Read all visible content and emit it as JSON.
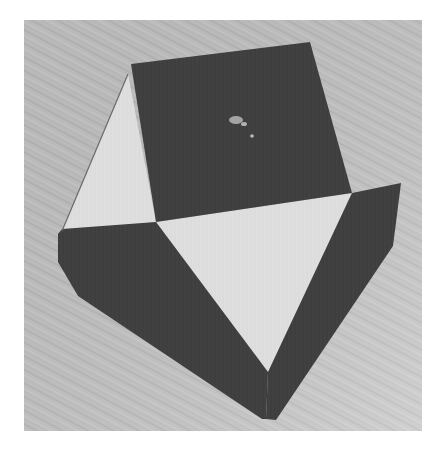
{
  "image": {
    "description": "Grayscale photograph of a folded paper pentagon-like shape on a textured wood-grain surface",
    "colors": {
      "background": "#ffffff",
      "surface": "#c4c4c4",
      "surface_light": "#d6d6d6",
      "dark_paper": "#3e3e3e",
      "light_paper": "#dedede",
      "fold_line": "#5a5a5a"
    },
    "photo_bounds": {
      "x": 24,
      "y": 20,
      "width": 398,
      "height": 411
    },
    "shapes": {
      "dark_square": "131,64 310,42 352,193 156,222",
      "light_left_triangle": "128,74 156,222 62,231",
      "light_center_triangle": "156,222 352,193 268,372",
      "dark_left_band": "58,234 62,229 156,222 268,372 266,419 262,419 78,296 58,262",
      "dark_right_band": "352,193 401,183 393,246 276,420 266,419 268,372",
      "glare_spot": "238,120"
    }
  }
}
